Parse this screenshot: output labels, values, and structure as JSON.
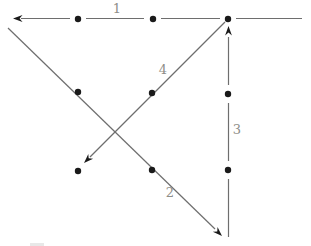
{
  "figure": {
    "background_color": "#ffffff",
    "line_color": "#6e6e6e",
    "marker_color": "#1a1a1a",
    "label_color": "#8e8e88",
    "label_font_size": 13,
    "dot_radius": 3.2,
    "canvas": {
      "width": 311,
      "height": 246
    },
    "nodes": [
      {
        "x": 78,
        "y": 19
      },
      {
        "x": 153,
        "y": 19
      },
      {
        "x": 228,
        "y": 19
      },
      {
        "x": 78,
        "y": 92
      },
      {
        "x": 152,
        "y": 93
      },
      {
        "x": 228,
        "y": 94
      },
      {
        "x": 78,
        "y": 171
      },
      {
        "x": 152,
        "y": 170
      },
      {
        "x": 228,
        "y": 170
      }
    ],
    "edges": [
      {
        "label": "1",
        "direction": "left",
        "label_x": 117,
        "label_y": 13,
        "segments": [
          [
            302,
            18.5,
            236,
            18.5
          ],
          [
            220,
            18.5,
            161,
            18.5
          ],
          [
            144,
            18.5,
            86,
            18.5
          ],
          [
            70,
            18.5,
            21,
            18.5
          ]
        ],
        "arrow_tip": [
          13,
          18.5
        ],
        "arrow_angle": 180
      },
      {
        "label": "2",
        "direction": "down-right",
        "label_x": 170,
        "label_y": 197,
        "segments": [
          [
            8,
            28,
            215,
            229
          ]
        ],
        "arrow_tip": [
          222,
          236
        ],
        "arrow_angle": 44
      },
      {
        "label": "3",
        "direction": "up",
        "label_x": 237,
        "label_y": 134,
        "segments": [
          [
            228.5,
            237,
            228.5,
            179
          ],
          [
            228.5,
            161,
            228.5,
            103
          ],
          [
            228.5,
            85,
            228.5,
            37
          ]
        ],
        "arrow_tip": [
          228.5,
          26
        ],
        "arrow_angle": -90
      },
      {
        "label": "4",
        "direction": "down-left",
        "label_x": 163,
        "label_y": 74,
        "segments": [
          [
            225,
            22,
            90,
            157
          ]
        ],
        "arrow_tip": [
          84,
          163
        ],
        "arrow_angle": 135
      }
    ],
    "artifact": {
      "x": 30,
      "y": 243,
      "width": 14,
      "height": 3,
      "color": "#e8e8e8"
    }
  }
}
